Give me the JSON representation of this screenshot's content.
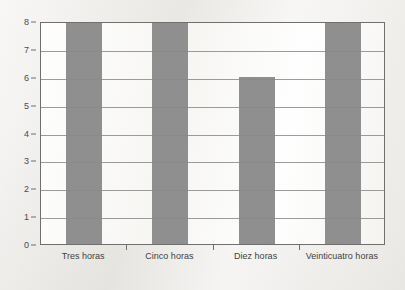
{
  "chart_data": {
    "type": "bar",
    "title": "",
    "subtitle": "",
    "xlabel": "",
    "ylabel": "",
    "categories": [
      "Tres horas",
      "Cinco horas",
      "Diez horas",
      "Veinticuatro horas"
    ],
    "values": [
      8,
      8,
      6,
      8
    ],
    "ylim": [
      0,
      8
    ],
    "ytick_labels": [
      "0",
      "1",
      "2",
      "3",
      "4",
      "5",
      "6",
      "7",
      "8"
    ],
    "ytick_values": [
      0,
      1,
      2,
      3,
      4,
      5,
      6,
      7,
      8
    ],
    "grid": true,
    "grid_axis": "y",
    "legend": false,
    "legend_position": "none",
    "annotations": [],
    "series": [
      {
        "name": "",
        "values": [
          8,
          8,
          6,
          8
        ]
      }
    ],
    "colors": {
      "bar_fill": "#8f8f8f",
      "grid": "#8a8a8a",
      "frame": "#6f6f6f",
      "plot_background": "#fafaf8",
      "page_background": "#efeeeb",
      "tick_text": "#4a4a4a",
      "category_text": "#3f3f3f"
    }
  }
}
